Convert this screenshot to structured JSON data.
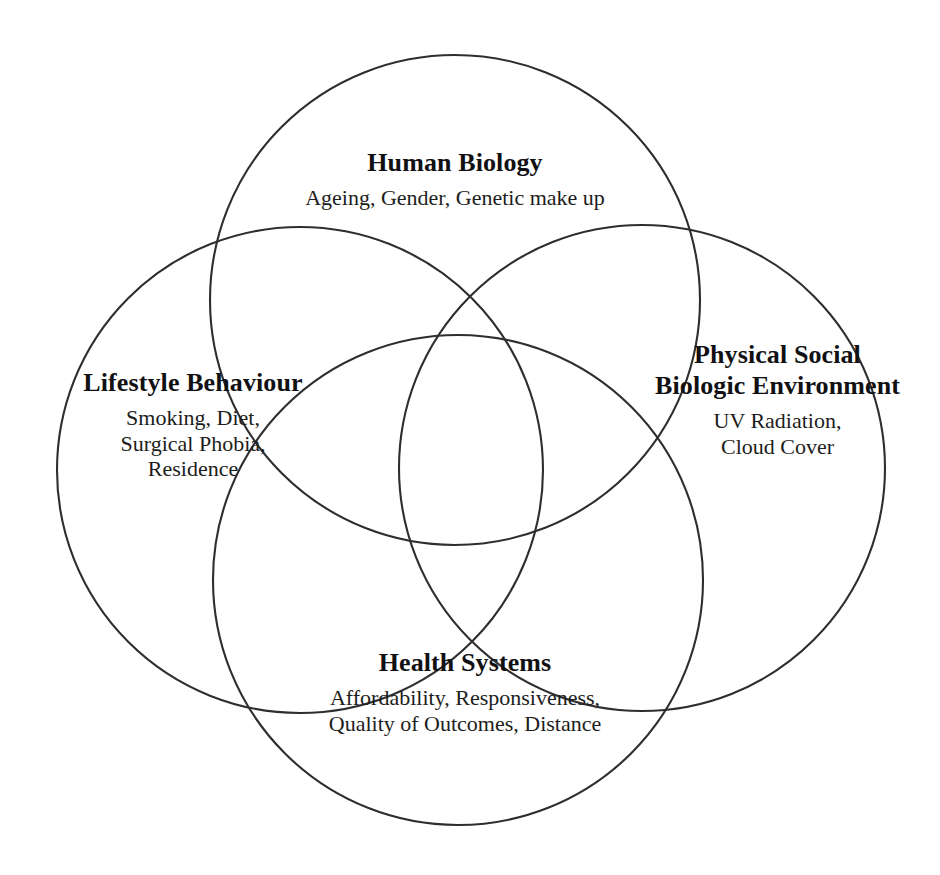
{
  "diagram": {
    "type": "venn-four-circle",
    "background_color": "#ffffff",
    "stroke_color": "#2e2e30",
    "circles": [
      {
        "id": "human-biology",
        "position": "top",
        "cx": 455,
        "cy": 300,
        "r": 245,
        "title": "Human Biology",
        "items": [
          "Ageing, Gender, Genetic make up"
        ]
      },
      {
        "id": "lifestyle-behaviour",
        "position": "left",
        "cx": 300,
        "cy": 470,
        "r": 243,
        "title": "Lifestyle Behaviour",
        "title_lines": [
          "Lifestyle",
          "Behaviour"
        ],
        "items": [
          "Smoking, Diet,",
          "Surgical Phobia,",
          "Residence"
        ]
      },
      {
        "id": "environment",
        "position": "right",
        "cx": 642,
        "cy": 468,
        "r": 243,
        "title": "Physical Social Biologic Environment",
        "title_lines": [
          "Physical",
          "Social",
          "Biologic",
          "Environment"
        ],
        "items": [
          "UV Radiation,",
          "Cloud Cover"
        ]
      },
      {
        "id": "health-systems",
        "position": "bottom",
        "cx": 458,
        "cy": 580,
        "r": 245,
        "title": "Health Systems",
        "items": [
          "Affordability, Responsiveness,",
          "Quality of Outcomes, Distance"
        ]
      }
    ]
  },
  "chart_data": {
    "type": "diagram",
    "subtype": "venn",
    "title": "",
    "sets": [
      {
        "name": "Human Biology",
        "position": "top",
        "members": [
          "Ageing",
          "Gender",
          "Genetic make up"
        ]
      },
      {
        "name": "Lifestyle Behaviour",
        "position": "left",
        "members": [
          "Smoking",
          "Diet",
          "Surgical Phobia",
          "Residence"
        ]
      },
      {
        "name": "Physical Social Biologic Environment",
        "position": "right",
        "members": [
          "UV Radiation",
          "Cloud Cover"
        ]
      },
      {
        "name": "Health Systems",
        "position": "bottom",
        "members": [
          "Affordability",
          "Responsiveness",
          "Quality of Outcomes",
          "Distance"
        ]
      }
    ]
  }
}
